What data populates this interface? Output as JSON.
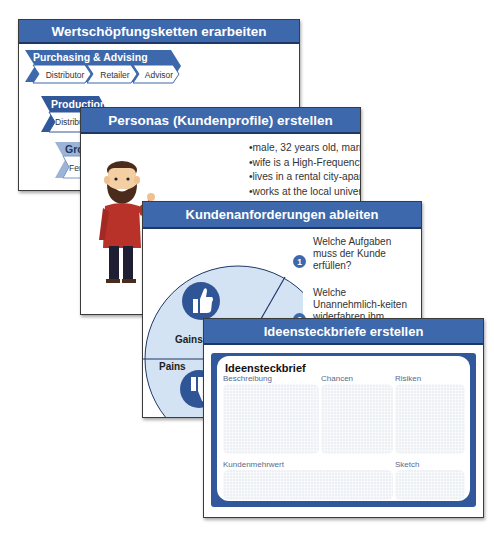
{
  "slides": [
    {
      "title": "Wertschöpfungsketten erarbeiten",
      "chains": [
        {
          "title": "Purchasing & Advising",
          "items": [
            "Distributor",
            "Retailer",
            "Advisor"
          ]
        },
        {
          "title": "Production",
          "items": [
            "Distributor"
          ]
        },
        {
          "title": "Grow",
          "items": [
            "Ferti"
          ]
        }
      ]
    },
    {
      "title": "Personas (Kundenprofile) erstellen",
      "bullets": [
        "male, 32 years old, married, no children",
        "wife is a High-Frequency Commuter",
        "lives in a rental city-apartment with his wife",
        "works at the local univerity: makes a point",
        "of flexible working hours and a good"
      ]
    },
    {
      "title": "Kundenanforderungen ableiten",
      "questions": [
        {
          "num": "1",
          "text": "Welche Aufgaben muss der Kunde erfüllen?"
        },
        {
          "num": "2",
          "text": "Welche Unannehmlich-keiten widerfahren ihm während er seine Aufgaben erfüllt?"
        }
      ],
      "segments": {
        "gains": "Gains",
        "pains": "Pains",
        "badge": "3"
      }
    },
    {
      "title": "Ideensteckbriefe erstellen",
      "card_title": "Ideensteckbrief",
      "fields": [
        "Beschreibung",
        "Chancen",
        "Risiken",
        "Kundenmehrwert",
        "Sketch"
      ]
    }
  ],
  "colors": {
    "header": "#3d68ab",
    "header_dark": "#1e3766",
    "pie_fill": "#d4e3f4",
    "icon_blue": "#2f5597"
  }
}
